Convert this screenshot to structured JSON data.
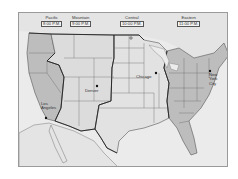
{
  "map": {
    "title": "U.S. Time Zones",
    "colors": {
      "background": "#ffffff",
      "water": "#ebebeb",
      "pacific_eastern_fill": "#bdbdbd",
      "mountain_central_fill": "#dcdcdc",
      "border": "#555555",
      "zone_boundary": "#222222"
    },
    "time_zones": [
      {
        "name": "Pacific",
        "time": "8:00 P.M."
      },
      {
        "name": "Mountain",
        "time": "9:00 P.M."
      },
      {
        "name": "Central",
        "time": "10:00 P.M."
      },
      {
        "name": "Eastern",
        "time": "11:00 P.M."
      }
    ],
    "cities": [
      {
        "name": "Los Angeles"
      },
      {
        "name": "Denver"
      },
      {
        "name": "Chicago"
      },
      {
        "name": "New York City"
      }
    ]
  }
}
